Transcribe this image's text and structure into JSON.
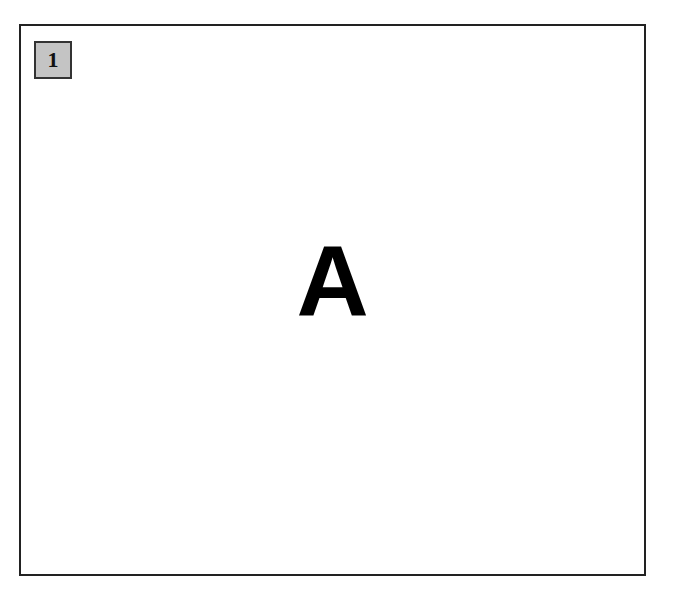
{
  "panel": {
    "number_badge": "1",
    "letter": "A"
  },
  "colors": {
    "frame_border": "#222222",
    "badge_background": "#c4c4c4",
    "letter": "#000000"
  }
}
